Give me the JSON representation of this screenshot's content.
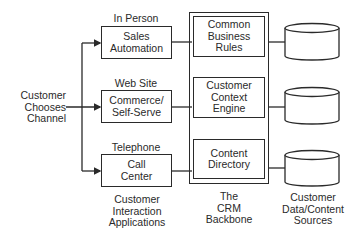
{
  "diagram": {
    "input": {
      "label_lines": [
        "Customer",
        "Chooses",
        "Channel"
      ]
    },
    "channels": [
      {
        "channel": "In Person",
        "app_lines": [
          "Sales",
          "Automation"
        ]
      },
      {
        "channel": "Web Site",
        "app_lines": [
          "Commerce/",
          "Self-Serve"
        ]
      },
      {
        "channel": "Telephone",
        "app_lines": [
          "Call",
          "Center"
        ]
      }
    ],
    "backbone": {
      "components": [
        {
          "lines": [
            "Common",
            "Business",
            "Rules"
          ]
        },
        {
          "lines": [
            "Customer",
            "Context",
            "Engine"
          ]
        },
        {
          "lines": [
            "Content",
            "Directory"
          ]
        }
      ],
      "caption_lines": [
        "The",
        "CRM",
        "Backbone"
      ]
    },
    "data_sources": {
      "count": 3,
      "caption_lines": [
        "Customer",
        "Data/Content",
        "Sources"
      ]
    },
    "column_captions": {
      "applications_lines": [
        "Customer",
        "Interaction",
        "Applications"
      ]
    }
  }
}
